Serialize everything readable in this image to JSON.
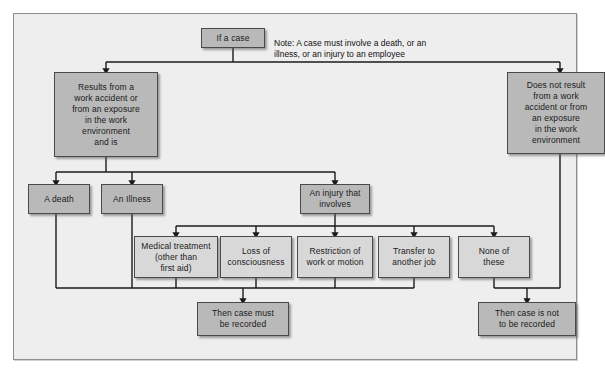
{
  "diagram": {
    "colors": {
      "panel_background": "#eeeeee",
      "panel_border": "#8f8f8f",
      "node_fill": "#b9b9b9",
      "node_fill_light": "#d8d8d8",
      "node_border": "#4a4a4a",
      "connector": "#1a1a1a",
      "text": "#1a1a1a"
    },
    "note": {
      "label": "Note: A case must involve a death, or an\nillness, or an injury to an employee"
    },
    "nodes": [
      {
        "id": "start",
        "label": "If a case"
      },
      {
        "id": "results-from",
        "label": "Results from a\nwork accident or\nfrom  an exposure\nin the work\nenvironment\nand is"
      },
      {
        "id": "does-not-result",
        "label": "Does not result\nfrom a work\naccident or from\nan exposure\nin the work\nenvironment"
      },
      {
        "id": "a-death",
        "label": "A death"
      },
      {
        "id": "an-illness",
        "label": "An Illness"
      },
      {
        "id": "an-injury",
        "label": "An injury that\ninvolves"
      },
      {
        "id": "medical-treatment",
        "label": "Medical treatment\n(other than\nfirst aid)"
      },
      {
        "id": "loss-of-consciousness",
        "label": "Loss of\nconsciousness"
      },
      {
        "id": "restriction",
        "label": "Restriction of\nwork or motion"
      },
      {
        "id": "transfer",
        "label": "Transfer to\nanother job"
      },
      {
        "id": "none-of-these",
        "label": "None of\nthese"
      },
      {
        "id": "must-be-recorded",
        "label": "Then case must\nbe recorded"
      },
      {
        "id": "not-to-be-recorded",
        "label": "Then case is not\nto be recorded"
      }
    ]
  }
}
